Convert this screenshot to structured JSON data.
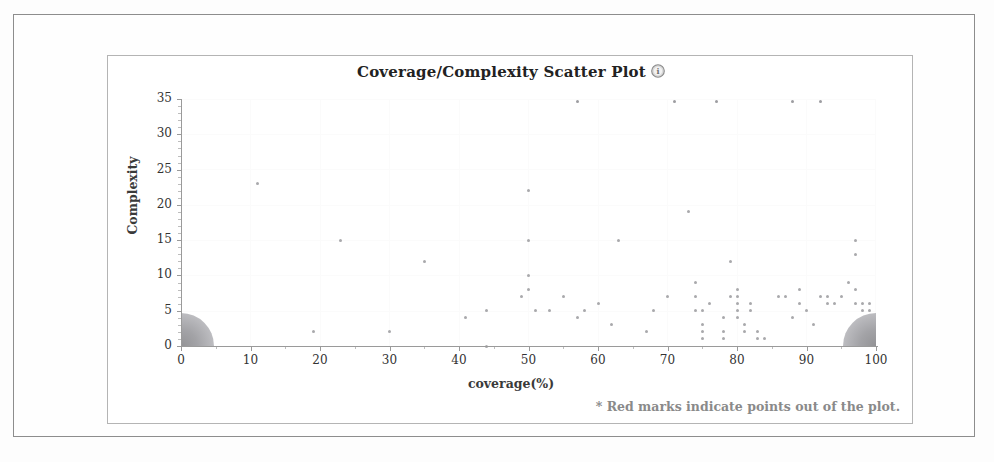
{
  "chart_data": {
    "type": "scatter",
    "title": "Coverage/Complexity Scatter Plot",
    "xlabel": "coverage(%)",
    "ylabel": "Complexity",
    "xlim": [
      0,
      100
    ],
    "ylim": [
      0,
      35
    ],
    "xticks": [
      0,
      10,
      20,
      30,
      40,
      50,
      60,
      70,
      80,
      90,
      100
    ],
    "yticks": [
      0,
      5,
      10,
      15,
      20,
      25,
      30,
      35
    ],
    "grid": true,
    "legend": null,
    "annotation": "* Red marks indicate points out of the plot.",
    "help_icon": "help-circle-icon",
    "out_of_plot_color": "#c23030",
    "point_color": "#a9a9ac",
    "series": [
      {
        "name": "modules",
        "points": [
          [
            11,
            23
          ],
          [
            19,
            2
          ],
          [
            23,
            15
          ],
          [
            30,
            2
          ],
          [
            35,
            12
          ],
          [
            41,
            4
          ],
          [
            44,
            5
          ],
          [
            44,
            0
          ],
          [
            49,
            7
          ],
          [
            50,
            22
          ],
          [
            50,
            15
          ],
          [
            50,
            10
          ],
          [
            50,
            8
          ],
          [
            51,
            5
          ],
          [
            53,
            5
          ],
          [
            55,
            7
          ],
          [
            57,
            4
          ],
          [
            58,
            5
          ],
          [
            60,
            6
          ],
          [
            62,
            3
          ],
          [
            63,
            15
          ],
          [
            67,
            2
          ],
          [
            68,
            5
          ],
          [
            70,
            7
          ],
          [
            73,
            19
          ],
          [
            74,
            5
          ],
          [
            74,
            7
          ],
          [
            74,
            9
          ],
          [
            75,
            5
          ],
          [
            75,
            3
          ],
          [
            75,
            1
          ],
          [
            75,
            2
          ],
          [
            76,
            6
          ],
          [
            78,
            4
          ],
          [
            78,
            2
          ],
          [
            78,
            1
          ],
          [
            79,
            7
          ],
          [
            79,
            12
          ],
          [
            80,
            8
          ],
          [
            80,
            7
          ],
          [
            80,
            6
          ],
          [
            80,
            5
          ],
          [
            80,
            4
          ],
          [
            81,
            3
          ],
          [
            81,
            2
          ],
          [
            82,
            6
          ],
          [
            82,
            5
          ],
          [
            83,
            2
          ],
          [
            83,
            1
          ],
          [
            84,
            1
          ],
          [
            86,
            7
          ],
          [
            87,
            7
          ],
          [
            88,
            4
          ],
          [
            89,
            8
          ],
          [
            89,
            6
          ],
          [
            90,
            5
          ],
          [
            91,
            3
          ],
          [
            92,
            7
          ],
          [
            93,
            7
          ],
          [
            93,
            6
          ],
          [
            94,
            6
          ],
          [
            95,
            7
          ],
          [
            96,
            9
          ],
          [
            97,
            15
          ],
          [
            97,
            13
          ],
          [
            97,
            8
          ],
          [
            97,
            6
          ],
          [
            98,
            6
          ],
          [
            98,
            5
          ],
          [
            99,
            6
          ],
          [
            99,
            5
          ]
        ]
      },
      {
        "name": "clipped_at_top",
        "note": "points drawn at the upper plot boundary (complexity >= 35)",
        "points": [
          [
            57,
            34.6
          ],
          [
            71,
            34.6
          ],
          [
            77,
            34.6
          ],
          [
            88,
            34.6
          ],
          [
            92,
            34.6
          ]
        ]
      }
    ],
    "out_of_plot_marks": [
      {
        "name": "origin-cluster",
        "anchor": "bottom-left",
        "x": 0,
        "y": 0,
        "radius_units": 4.7
      },
      {
        "name": "full-coverage-cluster",
        "anchor": "bottom-right",
        "x": 100,
        "y": 0,
        "radius_units": 4.7
      }
    ]
  }
}
